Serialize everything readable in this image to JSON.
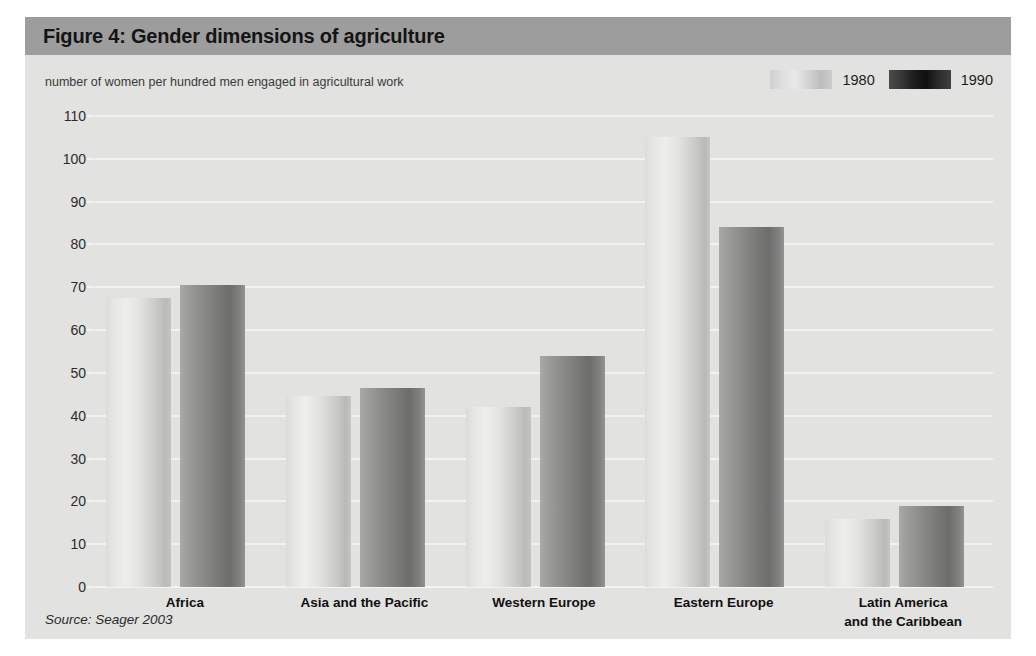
{
  "figure": {
    "title": "Figure 4: Gender dimensions of agriculture",
    "subtitle": "number of women per hundred men engaged in agricultural work",
    "source": "Source: Seager 2003"
  },
  "legend": {
    "position": "top-right",
    "entries": [
      {
        "label": "1980",
        "swatch": "light-gradient-swatch"
      },
      {
        "label": "1990",
        "swatch": "dark-gradient-swatch"
      }
    ]
  },
  "axis": {
    "y_ticks": [
      "110",
      "100",
      "90",
      "80",
      "70",
      "60",
      "50",
      "40",
      "30",
      "20",
      "10",
      "0"
    ]
  },
  "colors": {
    "panel_background": "#e2e2e0",
    "title_banner": "#9d9d9d",
    "gridline": "#f2f2f0",
    "bar_1980": "#e0e0de",
    "bar_1990": "#868684",
    "text": "#141414"
  },
  "chart_data": {
    "type": "bar",
    "title": "Figure 4: Gender dimensions of agriculture",
    "subtitle": "number of women per hundred men engaged in agricultural work",
    "xlabel": "",
    "ylabel": "number of women per hundred men engaged in agricultural work",
    "ylim": [
      0,
      110
    ],
    "ytick_step": 10,
    "grid": true,
    "legend_position": "top-right",
    "categories": [
      "Africa",
      "Asia and the Pacific",
      "Western Europe",
      "Eastern Europe",
      "Latin America and the Caribbean"
    ],
    "category_labels_wrapped": [
      [
        "Africa"
      ],
      [
        "Asia and the Pacific"
      ],
      [
        "Western Europe"
      ],
      [
        "Eastern Europe"
      ],
      [
        "Latin America",
        "and the Caribbean"
      ]
    ],
    "series": [
      {
        "name": "1980",
        "values": [
          67.5,
          44.5,
          42,
          105,
          16
        ]
      },
      {
        "name": "1990",
        "values": [
          70.5,
          46.5,
          54,
          84,
          19
        ]
      }
    ],
    "annotations": [
      "Source: Seager 2003"
    ]
  }
}
